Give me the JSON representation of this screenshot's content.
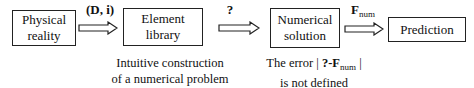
{
  "boxes": [
    {
      "line1": "Physical",
      "line2": "reality"
    },
    {
      "line1": "Element",
      "line2": "library"
    },
    {
      "line1": "Numerical",
      "line2": "solution"
    },
    {
      "line1": "Prediction"
    }
  ],
  "arrows": [
    {
      "label_open": "(",
      "label_D": "D",
      "label_sep": ", ",
      "label_i": "i",
      "label_close": ")"
    },
    {
      "label": "?"
    },
    {
      "label_main": "F",
      "label_sub": "num"
    }
  ],
  "notes": {
    "left_line1": "Intuitive construction",
    "left_line2": "of a numerical problem",
    "right_prefix": "The error | ",
    "right_bold": "?-F",
    "right_sub": "num",
    "right_suffix": " |",
    "right_line2": "is not defined"
  }
}
